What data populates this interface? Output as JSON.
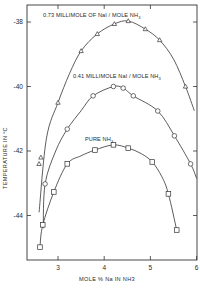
{
  "chart_data": {
    "type": "line",
    "title": "",
    "xlabel": "MOLE % Na IN NH3",
    "ylabel": "TEMPERATURE IN °C",
    "xlim": [
      2.35,
      6.0
    ],
    "ylim": [
      -45.4,
      -37.5
    ],
    "x_ticks": [
      3,
      4,
      5,
      6
    ],
    "x_tick_labels": [
      "3",
      "4",
      "5",
      "6"
    ],
    "y_ticks": [
      -38,
      -40,
      -42,
      -44
    ],
    "y_tick_labels": [
      "-38",
      "-40",
      "-42",
      "-44"
    ],
    "grid": false,
    "legend": "inline labels above each curve",
    "series": [
      {
        "name": "0.73 MILLIMOLE OF NaI/MOLE NH3",
        "marker": "triangle",
        "x": [
          2.59,
          2.63,
          3.0,
          3.5,
          3.85,
          4.22,
          4.52,
          4.89,
          5.2,
          5.76
        ],
        "y": [
          -42.4,
          -42.2,
          -40.5,
          -38.9,
          -38.37,
          -38.06,
          -37.97,
          -38.22,
          -38.56,
          -40.0
        ],
        "curve_x": [
          2.59,
          2.75,
          3.0,
          3.25,
          3.5,
          3.85,
          4.22,
          4.52,
          4.89,
          5.2,
          5.5,
          5.76,
          5.95
        ],
        "curve_y": [
          -43.9,
          -41.6,
          -40.5,
          -39.6,
          -38.9,
          -38.37,
          -38.06,
          -37.97,
          -38.22,
          -38.56,
          -39.15,
          -40.0,
          -40.75
        ]
      },
      {
        "name": "0.41 MILLIMOLE NaI/MOLE NH3",
        "marker": "circle",
        "x": [
          2.72,
          3.2,
          3.76,
          4.2,
          4.41,
          4.63,
          5.16,
          5.52,
          5.87
        ],
        "y": [
          -43.02,
          -41.32,
          -40.29,
          -40.0,
          -40.05,
          -40.29,
          -40.76,
          -41.53,
          -42.4
        ],
        "curve_x": [
          2.68,
          2.72,
          2.95,
          3.2,
          3.5,
          3.76,
          4.2,
          4.41,
          4.63,
          5.16,
          5.52,
          5.87,
          6.0
        ],
        "curve_y": [
          -44.4,
          -43.02,
          -42.0,
          -41.32,
          -40.75,
          -40.29,
          -40.0,
          -40.05,
          -40.29,
          -40.76,
          -41.53,
          -42.4,
          -42.85
        ]
      },
      {
        "name": "PURE NH3",
        "marker": "square",
        "x": [
          2.61,
          2.67,
          2.91,
          3.2,
          3.8,
          4.2,
          4.52,
          5.04,
          5.39,
          5.57
        ],
        "y": [
          -44.98,
          -44.29,
          -43.27,
          -42.4,
          -41.97,
          -41.81,
          -41.91,
          -42.34,
          -43.33,
          -44.45
        ],
        "curve_x": [
          2.61,
          2.67,
          2.91,
          3.2,
          3.5,
          3.8,
          4.2,
          4.52,
          4.8,
          5.04,
          5.25,
          5.39,
          5.57
        ],
        "curve_y": [
          -44.98,
          -44.29,
          -43.27,
          -42.4,
          -42.15,
          -41.97,
          -41.81,
          -41.91,
          -42.08,
          -42.34,
          -42.8,
          -43.33,
          -44.45
        ]
      }
    ],
    "labels": {
      "series_0": "0.73 MILLIMOLE OF NaI / MOLE NH",
      "series_1": "0.41 MILLIMOLE  NaI / MOLE NH",
      "series_2": "PURE NH",
      "subscript": "3"
    }
  }
}
